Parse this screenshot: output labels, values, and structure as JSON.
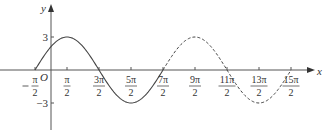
{
  "chart_data": {
    "type": "line",
    "title": "",
    "function": "y = 3 sin(x/2 + π/4)",
    "xlabel": "x",
    "ylabel": "y",
    "origin_label": "O",
    "x_ticks": [
      {
        "num": "π",
        "den": "2",
        "neg": true,
        "value": -0.5
      },
      {
        "num": "π",
        "den": "2",
        "neg": false,
        "value": 0.5
      },
      {
        "num": "3π",
        "den": "2",
        "neg": false,
        "value": 1.5
      },
      {
        "num": "5π",
        "den": "2",
        "neg": false,
        "value": 2.5
      },
      {
        "num": "7π",
        "den": "2",
        "neg": false,
        "value": 3.5
      },
      {
        "num": "9π",
        "den": "2",
        "neg": false,
        "value": 4.5
      },
      {
        "num": "11π",
        "den": "2",
        "neg": false,
        "value": 5.5
      },
      {
        "num": "13π",
        "den": "2",
        "neg": false,
        "value": 6.5
      },
      {
        "num": "15π",
        "den": "2",
        "neg": false,
        "value": 7.5
      }
    ],
    "y_ticks": [
      {
        "label": "3",
        "value": 3
      },
      {
        "label": "-3",
        "value": -3
      }
    ],
    "series": [
      {
        "name": "solid segment",
        "style": "solid",
        "x_range_pi": [
          -0.5,
          3.5
        ],
        "key_points": [
          {
            "x": "-π/2",
            "y": 0
          },
          {
            "x": "π/2",
            "y": 3
          },
          {
            "x": "3π/2",
            "y": 0
          },
          {
            "x": "5π/2",
            "y": -3
          },
          {
            "x": "7π/2",
            "y": 0
          }
        ]
      },
      {
        "name": "dashed segment",
        "style": "dashed",
        "x_range_pi": [
          3.5,
          7.5
        ],
        "key_points": [
          {
            "x": "7π/2",
            "y": 0
          },
          {
            "x": "9π/2",
            "y": 3
          },
          {
            "x": "11π/2",
            "y": 0
          },
          {
            "x": "13π/2",
            "y": -3
          },
          {
            "x": "15π/2",
            "y": 0
          }
        ]
      }
    ],
    "amplitude": 3,
    "period": "4π",
    "grid": false,
    "legend": null
  }
}
